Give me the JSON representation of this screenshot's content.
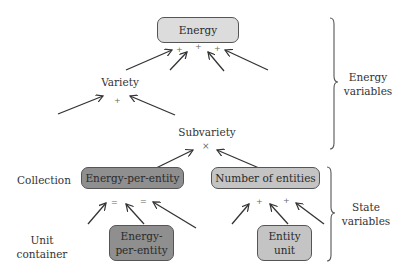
{
  "nodes": {
    "energy": "Energy",
    "variety": "Variety",
    "subvariety": "Subvariety",
    "collection_energy_per_entity": "Energy-per-entity",
    "number_of_entities": "Number of entities",
    "unit_energy_per_entity_line1": "Energy-",
    "unit_energy_per_entity_line2": "per-entity",
    "entity_unit_line1": "Entity",
    "entity_unit_line2": "unit"
  },
  "operators": {
    "energy_plus_1": "+",
    "energy_plus_2": "+",
    "energy_plus_3": "+",
    "variety_plus": "+",
    "subvariety_times": "×",
    "collection_eq_1": "=",
    "collection_eq_2": "=",
    "entities_plus_1": "+",
    "entities_plus_2": "+"
  },
  "row_labels": {
    "collection": "Collection",
    "unit_container_line1": "Unit",
    "unit_container_line2": "container"
  },
  "brace_labels": {
    "energy_variables_line1": "Energy",
    "energy_variables_line2": "variables",
    "state_variables_line1": "State",
    "state_variables_line2": "variables"
  },
  "colors": {
    "light_box": "#dcdcdc",
    "mid_box": "#c4c4c4",
    "dark_box": "#8f8f8f",
    "stroke": "#333333"
  }
}
